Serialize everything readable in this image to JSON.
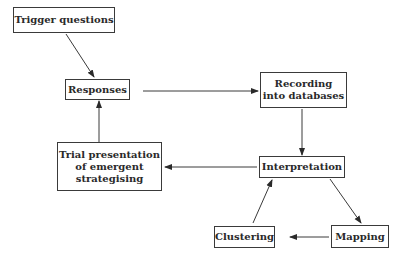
{
  "diagram": {
    "nodes": [
      {
        "id": "trigger",
        "label": "Trigger  questions"
      },
      {
        "id": "responses",
        "label": "Responses"
      },
      {
        "id": "recording",
        "label": "Recording\ninto databases"
      },
      {
        "id": "interpretation",
        "label": "Interpretation"
      },
      {
        "id": "trial",
        "label": "Trial presentation\nof emergent\nstrategising"
      },
      {
        "id": "clustering",
        "label": "Clustering"
      },
      {
        "id": "mapping",
        "label": "Mapping"
      }
    ],
    "edges": [
      {
        "from": "trigger",
        "to": "responses"
      },
      {
        "from": "responses",
        "to": "recording"
      },
      {
        "from": "recording",
        "to": "interpretation"
      },
      {
        "from": "interpretation",
        "to": "trial"
      },
      {
        "from": "trial",
        "to": "responses"
      },
      {
        "from": "interpretation",
        "to": "mapping"
      },
      {
        "from": "mapping",
        "to": "clustering"
      },
      {
        "from": "clustering",
        "to": "interpretation"
      }
    ],
    "colors": {
      "stroke": "#3a3a3a",
      "text": "#2a2a2a",
      "background": "#ffffff"
    }
  }
}
